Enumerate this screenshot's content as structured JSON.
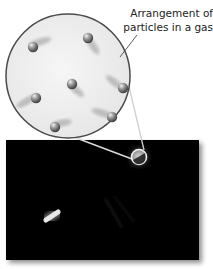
{
  "diagram": {
    "label": {
      "line1": "Arrangement of",
      "line2": "particles in a gas"
    },
    "magnified_view": {
      "description": "Magnified circle showing gas particles spread apart with motion trails",
      "particle_count": 8
    },
    "photo": {
      "description": "Dark photograph with a small circled region and a glowing streak"
    },
    "colors": {
      "circle_fill": "#eeeeee",
      "circle_border": "#4a4a4a",
      "particle": "#7a7a7a",
      "panel": "#050505",
      "leader": "#333333"
    }
  }
}
